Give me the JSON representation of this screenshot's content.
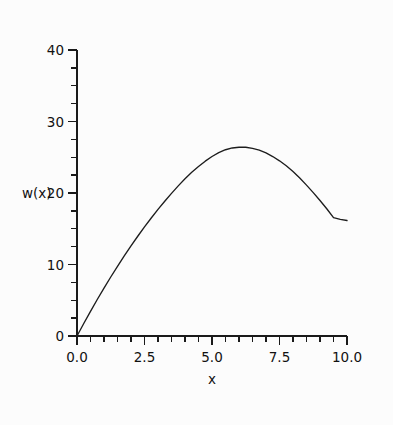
{
  "chart_data": {
    "type": "line",
    "title": "",
    "subtitle": "",
    "xlabel": "x",
    "ylabel": "w(x)",
    "xlim": [
      0.0,
      10.0
    ],
    "ylim": [
      0,
      40
    ],
    "grid": false,
    "legend": null,
    "x_ticks": [
      0.0,
      2.5,
      5.0,
      7.5,
      10.0
    ],
    "x_tick_labels": [
      "0.0",
      "2.5",
      "5.0",
      "7.5",
      "10.0"
    ],
    "x_minor_tick_step": 0.5,
    "y_ticks": [
      0,
      10,
      20,
      30,
      40
    ],
    "y_tick_labels": [
      "0",
      "10",
      "20",
      "30",
      "40"
    ],
    "y_minor_tick_step": 2.5,
    "series": [
      {
        "name": "w(x)",
        "color": "#1d1d1d",
        "x": [
          0.0,
          0.25,
          0.5,
          0.75,
          1.0,
          1.25,
          1.5,
          1.75,
          2.0,
          2.25,
          2.5,
          2.75,
          3.0,
          3.25,
          3.5,
          3.75,
          4.0,
          4.25,
          4.5,
          4.75,
          5.0,
          5.25,
          5.5,
          5.75,
          6.0,
          6.25,
          6.5,
          6.75,
          7.0,
          7.25,
          7.5,
          7.75,
          8.0,
          8.25,
          8.5,
          8.75,
          9.0,
          9.25,
          9.5,
          9.75,
          10.0
        ],
        "y": [
          0.0,
          1.75,
          3.45,
          5.1,
          6.7,
          8.25,
          9.75,
          11.2,
          12.6,
          13.95,
          15.25,
          16.5,
          17.7,
          18.85,
          19.95,
          21.0,
          22.0,
          22.9,
          23.7,
          24.45,
          25.1,
          25.65,
          26.05,
          26.3,
          26.4,
          26.4,
          26.25,
          26.0,
          25.6,
          25.1,
          24.5,
          23.8,
          23.0,
          22.1,
          21.1,
          20.05,
          18.95,
          17.8,
          16.55,
          16.3,
          16.15
        ]
      }
    ],
    "annotations": {
      "peak_x": 6.0,
      "peak_y": 26.4,
      "start_point": [
        0.0,
        0.0
      ],
      "end_point": [
        10.0,
        16.15
      ]
    }
  },
  "figure": {
    "background_color": "#fcfcfc",
    "axis_color": "#1a1a1a",
    "curve_color": "#1d1d1d"
  }
}
